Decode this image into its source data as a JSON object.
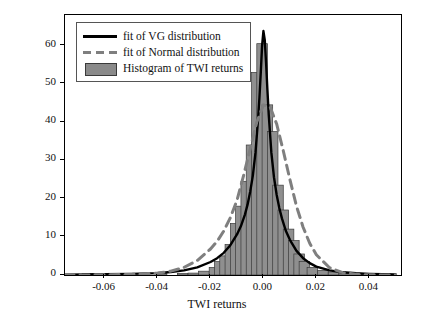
{
  "chart_data": {
    "type": "bar",
    "title": "",
    "xlabel": "TWI returns",
    "ylabel": "",
    "xlim": [
      -0.075,
      0.052
    ],
    "ylim": [
      0,
      68
    ],
    "grid": false,
    "legend_position": "top-left",
    "xticks": [
      -0.06,
      -0.04,
      -0.02,
      0.0,
      0.02,
      0.04
    ],
    "xtick_labels": [
      "-0.06",
      "-0.04",
      "-0.02",
      "0.00",
      "0.02",
      "0.04"
    ],
    "yticks": [
      0,
      10,
      20,
      30,
      40,
      50,
      60
    ],
    "ytick_labels": [
      "0",
      "10",
      "20",
      "30",
      "40",
      "50",
      "60"
    ],
    "legend": [
      {
        "label": "fit of VG distribution",
        "key": "solid-line",
        "color": "#000000"
      },
      {
        "label": "fit of Normal distribution",
        "key": "dashed-line",
        "color": "#7f7f7f"
      },
      {
        "label": "Histogram of TWI returns",
        "key": "filled-bar",
        "color": "#8a8a8a"
      }
    ],
    "series": [
      {
        "name": "Histogram of TWI returns",
        "type": "bar",
        "bin_centers": [
          -0.0665,
          -0.0625,
          -0.0585,
          -0.0545,
          -0.0505,
          -0.0465,
          -0.0425,
          -0.0385,
          -0.0345,
          -0.0305,
          -0.0265,
          -0.0225,
          -0.0185,
          -0.0165,
          -0.0145,
          -0.0125,
          -0.0105,
          -0.0085,
          -0.0065,
          -0.0045,
          -0.0025,
          -0.0005,
          0.0015,
          0.0035,
          0.0055,
          0.0075,
          0.0095,
          0.0115,
          0.0135,
          0.0155,
          0.0185,
          0.0225,
          0.0265,
          0.0305,
          0.0345,
          0.0385,
          0.0425,
          0.0465
        ],
        "values": [
          0.4,
          0,
          0,
          0,
          0,
          0,
          0,
          0.5,
          0,
          0.4,
          0.5,
          1.0,
          2.0,
          3.5,
          5.0,
          8.0,
          13.5,
          18.0,
          24.5,
          34.0,
          53.0,
          60.5,
          44.5,
          37.5,
          23.5,
          17.0,
          12.0,
          9.0,
          5.5,
          3.5,
          2.0,
          1.2,
          0.8,
          0.5,
          0.3,
          0.3,
          0.2,
          0.2
        ]
      },
      {
        "name": "fit of VG distribution",
        "type": "line",
        "style": "solid",
        "color": "#000000",
        "x": [
          -0.075,
          -0.06,
          -0.05,
          -0.04,
          -0.035,
          -0.03,
          -0.025,
          -0.02,
          -0.0175,
          -0.015,
          -0.0125,
          -0.01,
          -0.0085,
          -0.007,
          -0.006,
          -0.005,
          -0.004,
          -0.003,
          -0.002,
          -0.0015,
          -0.001,
          -0.0005,
          0.0,
          0.0005,
          0.001,
          0.0015,
          0.002,
          0.003,
          0.004,
          0.005,
          0.006,
          0.007,
          0.0085,
          0.01,
          0.0125,
          0.015,
          0.0175,
          0.02,
          0.025,
          0.03,
          0.035,
          0.04,
          0.05
        ],
        "y": [
          0.1,
          0.2,
          0.3,
          0.5,
          0.8,
          1.2,
          2.0,
          3.4,
          4.4,
          5.8,
          7.8,
          10.6,
          12.8,
          15.8,
          18.4,
          21.8,
          26.0,
          32.0,
          41.0,
          46.5,
          53.0,
          60.0,
          63.8,
          61.5,
          55.5,
          48.5,
          42.0,
          32.0,
          25.5,
          21.0,
          17.5,
          14.8,
          11.5,
          9.2,
          6.3,
          4.4,
          3.1,
          2.2,
          1.2,
          0.7,
          0.45,
          0.3,
          0.15
        ]
      },
      {
        "name": "fit of Normal distribution",
        "type": "line",
        "style": "dashed",
        "color": "#7f7f7f",
        "x": [
          -0.075,
          -0.06,
          -0.05,
          -0.04,
          -0.035,
          -0.03,
          -0.025,
          -0.02,
          -0.0175,
          -0.015,
          -0.0125,
          -0.01,
          -0.0075,
          -0.005,
          -0.0025,
          0.0,
          0.0025,
          0.005,
          0.0075,
          0.01,
          0.0125,
          0.015,
          0.0175,
          0.02,
          0.025,
          0.03,
          0.035,
          0.04,
          0.05
        ],
        "y": [
          0.0,
          0.05,
          0.15,
          0.5,
          1.0,
          2.0,
          3.8,
          6.8,
          8.8,
          11.5,
          15.0,
          19.5,
          26.0,
          33.0,
          40.0,
          44.5,
          44.0,
          39.5,
          32.5,
          25.0,
          18.0,
          12.5,
          8.3,
          5.3,
          1.9,
          0.6,
          0.2,
          0.05,
          0.0
        ]
      }
    ]
  }
}
